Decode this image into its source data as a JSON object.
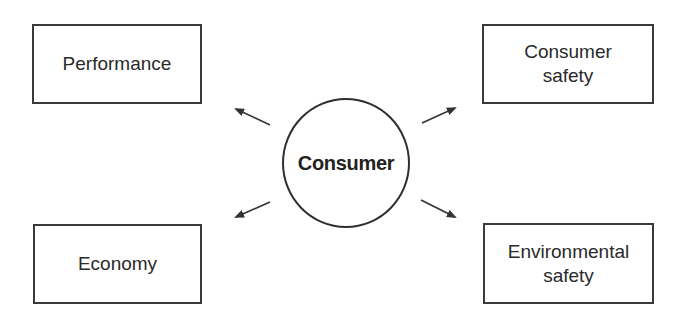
{
  "diagram": {
    "center": {
      "label": "Consumer"
    },
    "nodes": [
      {
        "id": "performance",
        "label": "Performance",
        "position": "top-left"
      },
      {
        "id": "consumer-safety",
        "label": "Consumer\nsafety",
        "position": "top-right"
      },
      {
        "id": "economy",
        "label": "Economy",
        "position": "bottom-left"
      },
      {
        "id": "environmental-safety",
        "label": "Environmental\nsafety",
        "position": "bottom-right"
      }
    ],
    "edges": [
      {
        "from": "Consumer",
        "to": "Performance",
        "icon": "arrow-up-left-icon"
      },
      {
        "from": "Consumer",
        "to": "Consumer safety",
        "icon": "arrow-up-right-icon"
      },
      {
        "from": "Consumer",
        "to": "Economy",
        "icon": "arrow-down-left-icon"
      },
      {
        "from": "Consumer",
        "to": "Environmental safety",
        "icon": "arrow-down-right-icon"
      }
    ],
    "colors": {
      "stroke": "#333333",
      "text": "#2a2a2a",
      "background": "#ffffff"
    }
  }
}
